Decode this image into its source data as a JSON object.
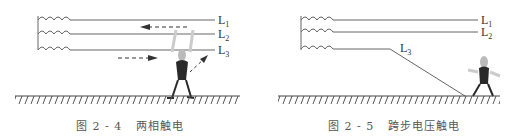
{
  "figures": [
    {
      "id": "fig-2-4",
      "caption_number": "图 2 - 4",
      "caption_title": "两相触电",
      "lines": [
        "L1",
        "L2",
        "L3"
      ]
    },
    {
      "id": "fig-2-5",
      "caption_number": "图 2 - 5",
      "caption_title": "跨步电压触电",
      "lines": [
        "L1",
        "L2",
        "L3"
      ]
    }
  ],
  "colors": {
    "line": "#555555",
    "figure": "#2a2a2a",
    "ground": "#444444"
  }
}
